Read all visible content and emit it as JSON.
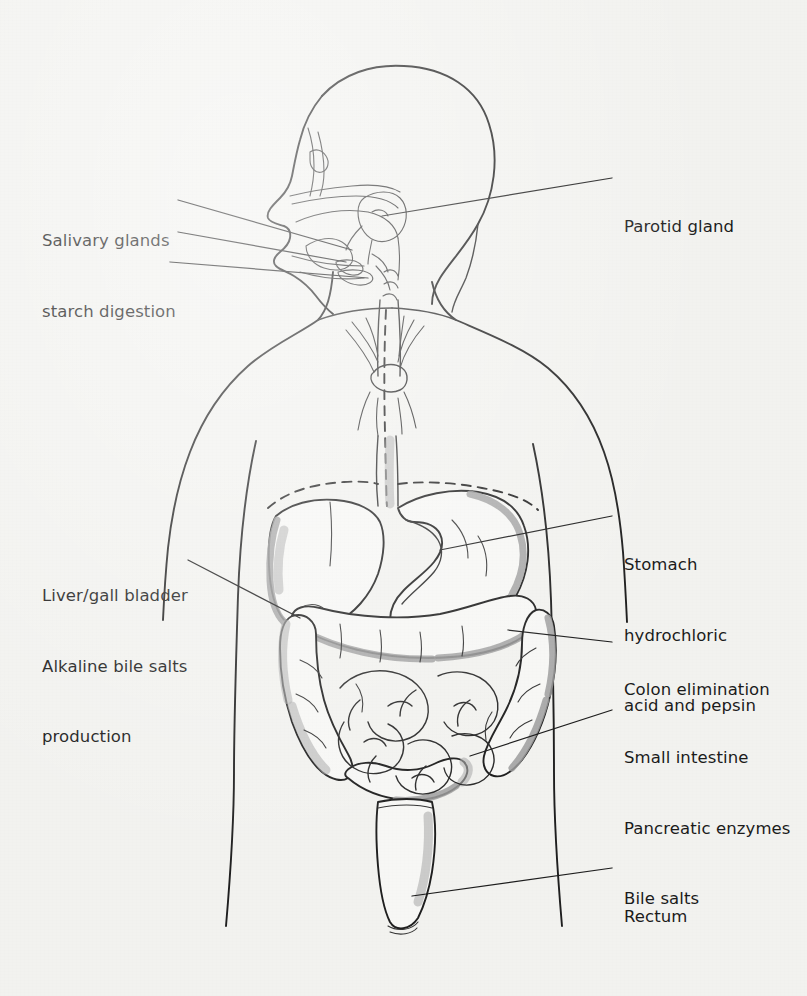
{
  "figure": {
    "view": "anterior body outline with left-facing head profile",
    "background_color": "#f2f2ef",
    "ink_color": "#1b1b1b",
    "shade_color": "#9a9a9a"
  },
  "labels": [
    {
      "id": "salivary-glands",
      "side": "left",
      "x": 42,
      "y": 182,
      "lines": [
        "Salivary glands",
        "starch digestion"
      ],
      "leader_count": 3
    },
    {
      "id": "parotid-gland",
      "side": "right",
      "x": 624,
      "y": 168,
      "lines": [
        "Parotid gland"
      ],
      "leader_count": 1
    },
    {
      "id": "liver-gall-bladder",
      "side": "left",
      "x": 42,
      "y": 537,
      "lines": [
        "Liver/gall bladder",
        "Alkaline bile salts",
        "production"
      ],
      "leader_count": 1
    },
    {
      "id": "stomach",
      "side": "right",
      "x": 624,
      "y": 506,
      "lines": [
        "Stomach",
        "hydrochloric",
        "acid and pepsin"
      ],
      "leader_count": 1
    },
    {
      "id": "colon-elimination",
      "side": "right",
      "x": 624,
      "y": 631,
      "lines": [
        "Colon elimination"
      ],
      "leader_count": 1
    },
    {
      "id": "small-intestine",
      "side": "right",
      "x": 624,
      "y": 699,
      "lines": [
        "Small intestine",
        "Pancreatic enzymes",
        "Bile salts"
      ],
      "leader_count": 1
    },
    {
      "id": "rectum",
      "side": "right",
      "x": 624,
      "y": 858,
      "lines": [
        "Rectum"
      ],
      "leader_count": 1
    }
  ],
  "organs": [
    "head profile",
    "nasal cavity",
    "oral cavity and tongue",
    "salivary glands",
    "parotid gland",
    "esophagus",
    "trachea and bronchi",
    "diaphragm",
    "liver",
    "gall bladder",
    "stomach",
    "transverse colon",
    "ascending colon",
    "descending colon",
    "small intestine",
    "rectum",
    "torso outline",
    "arms"
  ]
}
